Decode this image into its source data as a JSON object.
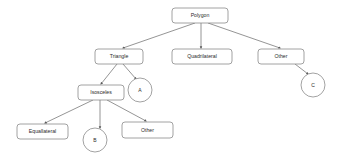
{
  "diagram": {
    "style": {
      "background": "#ffffff",
      "node_fill": "#ffffff",
      "node_stroke": "#8a8a8a",
      "edge_stroke": "#7a7a7a",
      "text_color": "#2b2b2b"
    },
    "nodes": [
      {
        "id": "polygon",
        "label": "Polygon",
        "shape": "rounded-rect",
        "x": 172,
        "y": 8,
        "w": 56,
        "h": 15
      },
      {
        "id": "triangle",
        "label": "Triangle",
        "shape": "rounded-rect",
        "x": 95,
        "y": 49,
        "w": 48,
        "h": 15
      },
      {
        "id": "quadrilateral",
        "label": "Quadrilateral",
        "shape": "rounded-rect",
        "x": 172,
        "y": 49,
        "w": 60,
        "h": 15
      },
      {
        "id": "other-top",
        "label": "Other",
        "shape": "rounded-rect",
        "x": 258,
        "y": 49,
        "w": 46,
        "h": 15
      },
      {
        "id": "isosceles",
        "label": "Isosceles",
        "shape": "rounded-rect",
        "x": 78,
        "y": 85,
        "w": 46,
        "h": 15
      },
      {
        "id": "equallateral",
        "label": "Equallateral",
        "shape": "rounded-rect",
        "x": 17,
        "y": 124,
        "w": 51,
        "h": 15
      },
      {
        "id": "other-bottom",
        "label": "Other",
        "shape": "rounded-rect",
        "x": 122,
        "y": 122,
        "w": 51,
        "h": 16
      },
      {
        "id": "circle-a",
        "label": "A",
        "shape": "circle",
        "cx": 140,
        "cy": 90,
        "r": 12
      },
      {
        "id": "circle-b",
        "label": "B",
        "shape": "circle",
        "cx": 95,
        "cy": 140,
        "r": 12
      },
      {
        "id": "circle-c",
        "label": "C",
        "shape": "circle",
        "cx": 313,
        "cy": 85,
        "r": 12
      }
    ],
    "edges": [
      {
        "id": "polygon-triangle",
        "from": "Polygon",
        "to": "Triangle",
        "x1": 195,
        "y1": 23,
        "x2": 123,
        "y2": 48
      },
      {
        "id": "polygon-quadrilateral",
        "from": "Polygon",
        "to": "Quadrilateral",
        "x1": 201,
        "y1": 23,
        "x2": 201,
        "y2": 48
      },
      {
        "id": "polygon-other",
        "from": "Polygon",
        "to": "Other",
        "x1": 208,
        "y1": 23,
        "x2": 280,
        "y2": 48
      },
      {
        "id": "other-c",
        "from": "Other",
        "to": "C",
        "x1": 295,
        "y1": 64,
        "x2": 308,
        "y2": 74
      },
      {
        "id": "triangle-isosceles",
        "from": "Triangle",
        "to": "Isosceles",
        "x1": 117,
        "y1": 64,
        "x2": 101,
        "y2": 84
      },
      {
        "id": "triangle-a",
        "from": "Triangle",
        "to": "A",
        "x1": 123,
        "y1": 64,
        "x2": 136,
        "y2": 79
      },
      {
        "id": "isosceles-equallateral",
        "from": "Isosceles",
        "to": "Equallateral",
        "x1": 93,
        "y1": 100,
        "x2": 45,
        "y2": 123
      },
      {
        "id": "isosceles-b",
        "from": "Isosceles",
        "to": "B",
        "x1": 100,
        "y1": 100,
        "x2": 100,
        "y2": 128
      },
      {
        "id": "isosceles-other",
        "from": "Isosceles",
        "to": "Other",
        "x1": 107,
        "y1": 100,
        "x2": 146,
        "y2": 121
      }
    ]
  }
}
